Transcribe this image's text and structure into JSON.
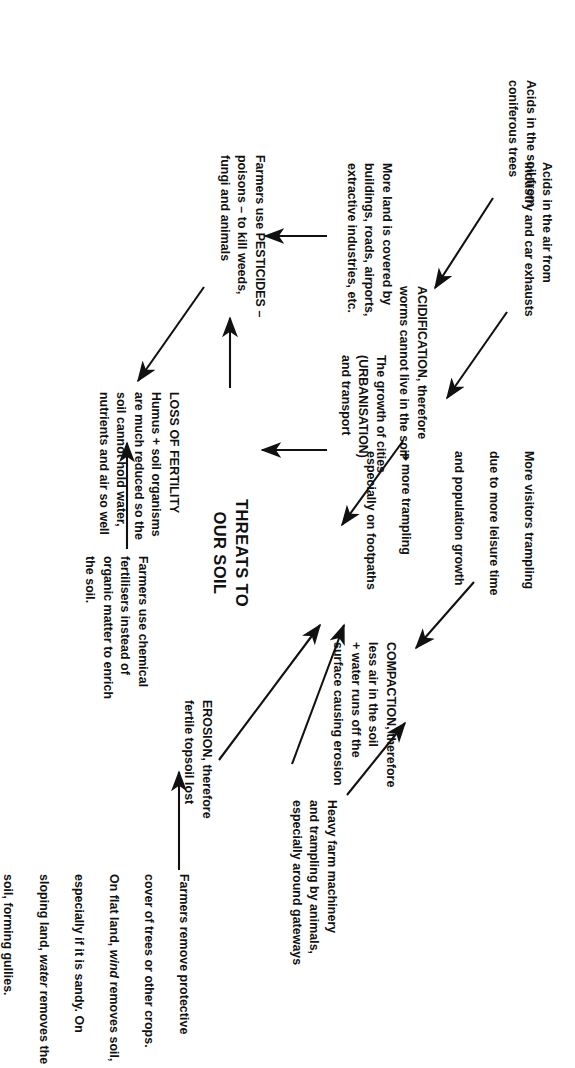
{
  "diagram": {
    "type": "concept-map",
    "orientation": "rotated-90-clockwise",
    "title": "THREATS TO\nOUR SOIL",
    "ink_color": "#111111",
    "background_color": "#ffffff",
    "nodes": {
      "acids_air": "Acids in the air from\nindustry and car exhausts",
      "acids_coniferous": "Acids in the soil from\nconiferous trees",
      "acidification": "ACIDIFICATION, therefore\nworms cannot live in the soil",
      "urbanisation": "The growth of cities\n(URBANISATION)\nand transport",
      "land_covered": "More land is covered by\nbuildings, roads, airports,\nextractive industries, etc.",
      "pesticides": "Farmers use PESTICIDES –\npoisons – to kill weeds,\nfungi and animals",
      "loss_of_fertility": "LOSS OF FERTILITY\nHumus + soil organisms\nare much reduced so the\nsoil cannot hold water,\nnutrients and air so well",
      "chemical_fertilisers": "Farmers use chemical\nfertilisers instead of\norganic matter to enrich\nthe soil.",
      "visitors_trampling_line1": "More visitors trampling",
      "visitors_trampling_line2": "due to more leisure time",
      "visitors_trampling_line3": "and population growth",
      "visitors_trampling_bullet": "➔",
      "visitors_trampling_line4": "more trampling",
      "visitors_trampling_line5": "especially on footpaths",
      "compaction": "COMPACTION, therefore\nless air in the soil\n+ water runs off the\nsurface causing erosion",
      "heavy_machinery": "Heavy farm machinery\nand trampling by animals,\nespecially around gateways",
      "erosion": "EROSION, therefore\nfertile topsoil lost",
      "farmers_remove_l1": "Farmers remove protective",
      "farmers_remove_l2": "cover of trees or other crops.",
      "farmers_remove_l3a": "On flat land, ",
      "farmers_remove_l3b": "wind",
      "farmers_remove_l3c": " removes soil,",
      "farmers_remove_l4": "especially if it is sandy. On",
      "farmers_remove_l5a": "sloping land, ",
      "farmers_remove_l5b": "water",
      "farmers_remove_l5c": " removes the",
      "farmers_remove_l6": "soil, forming gullies."
    },
    "edges": [
      {
        "from": "acids_air",
        "to": "acidification",
        "style": "solid-arrow"
      },
      {
        "from": "acids_coniferous",
        "to": "acidification",
        "style": "solid-arrow"
      },
      {
        "from": "acidification",
        "to": "title",
        "style": "solid-arrow"
      },
      {
        "from": "land_covered",
        "to": "urbanisation",
        "style": "solid-arrow"
      },
      {
        "from": "urbanisation",
        "to": "title",
        "style": "solid-arrow"
      },
      {
        "from": "pesticides",
        "to": "loss_of_fertility",
        "style": "solid-arrow"
      },
      {
        "from": "chemical_fertilisers",
        "to": "loss_of_fertility",
        "style": "solid-arrow"
      },
      {
        "from": "loss_of_fertility",
        "to": "title",
        "style": "solid-arrow"
      },
      {
        "from": "heavy_machinery",
        "to": "compaction",
        "style": "solid-arrow"
      },
      {
        "from": "visitors_trampling",
        "to": "compaction",
        "style": "solid-arrow"
      },
      {
        "from": "compaction",
        "to": "title",
        "style": "solid-arrow"
      },
      {
        "from": "farmers_remove",
        "to": "erosion",
        "style": "solid-arrow"
      },
      {
        "from": "erosion",
        "to": "title",
        "style": "solid-arrow"
      }
    ]
  }
}
